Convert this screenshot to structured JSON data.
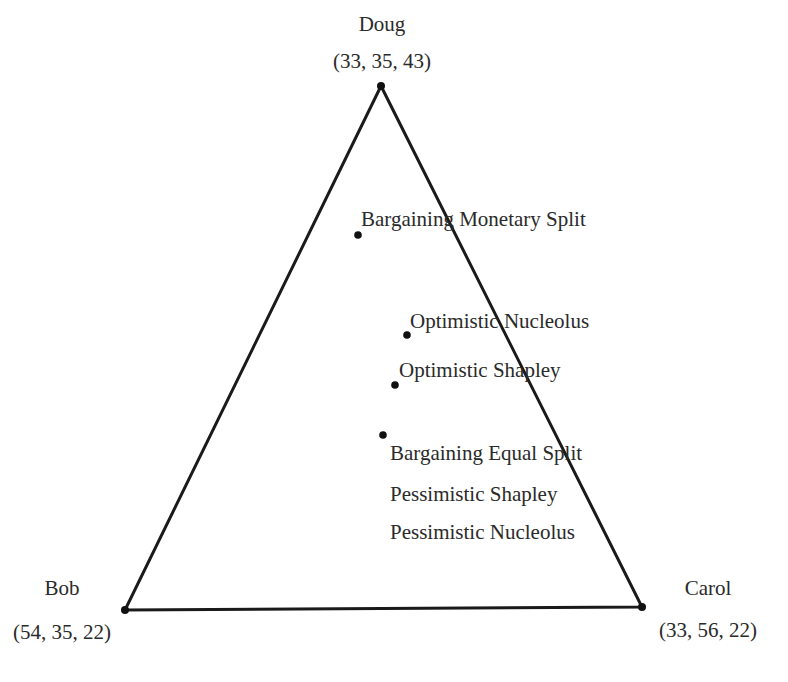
{
  "vertices": {
    "doug": {
      "name": "Doug",
      "coords": "(33, 35, 43)"
    },
    "bob": {
      "name": "Bob",
      "coords": "(54, 35, 22)"
    },
    "carol": {
      "name": "Carol",
      "coords": "(33, 56, 22)"
    }
  },
  "points": [
    {
      "label": "Bargaining Monetary Split"
    },
    {
      "label": "Optimistic Nucleolus"
    },
    {
      "label": "Optimistic Shapley"
    },
    {
      "label": "Bargaining Equal Split"
    },
    {
      "label": "Pessimistic Shapley"
    },
    {
      "label": "Pessimistic Nucleolus"
    }
  ],
  "colors": {
    "line": "#1a1a1a",
    "text": "#2a2a2a",
    "background": "#ffffff"
  }
}
